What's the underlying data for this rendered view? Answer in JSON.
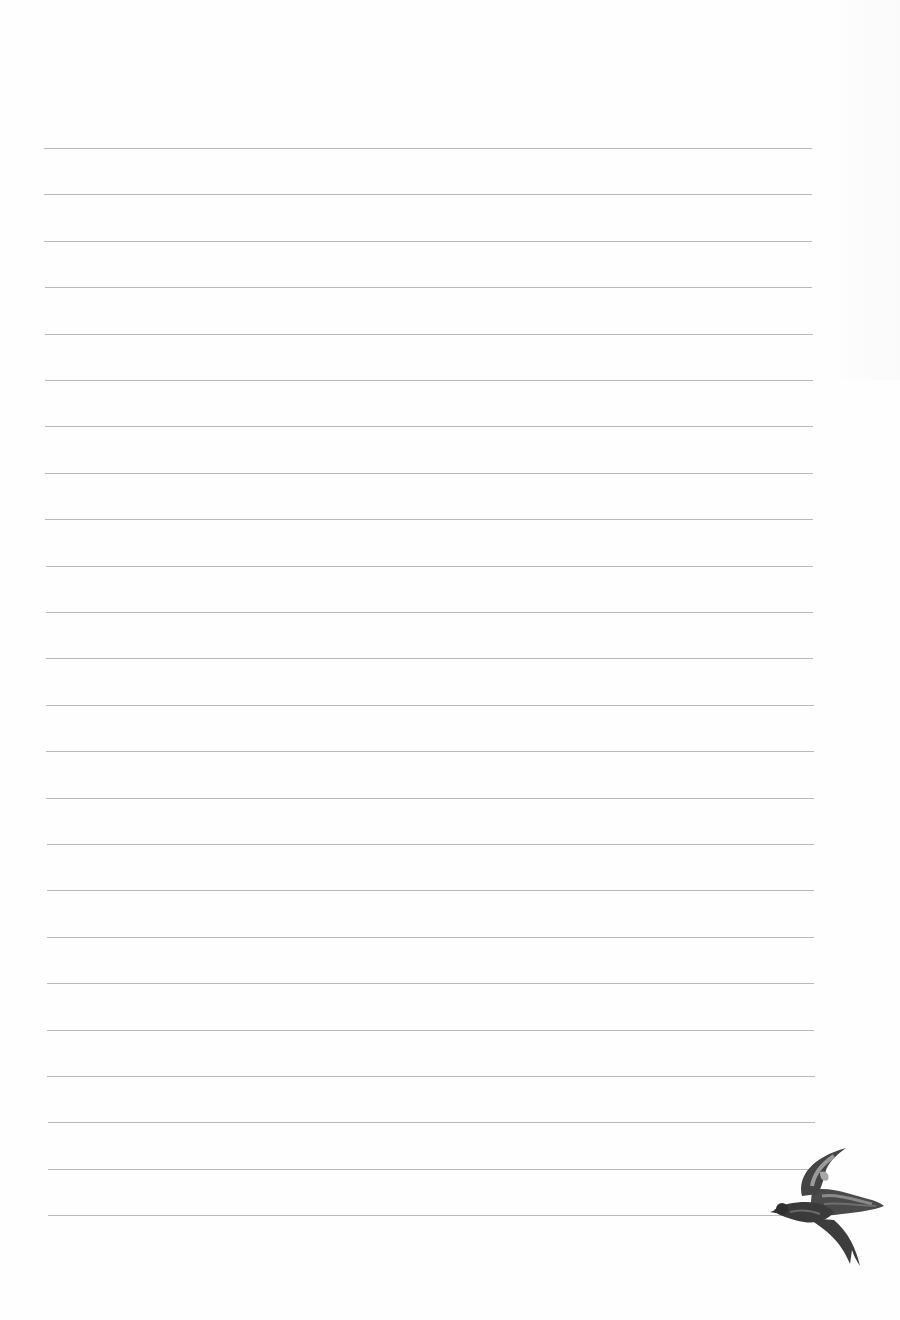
{
  "page": {
    "type": "lined-writing-paper",
    "background_color": "#fefefe",
    "line_color": "#b9b9b9",
    "line_count": 24,
    "first_line_y": 148,
    "line_spacing": 46.4,
    "line_left_top": 44,
    "line_left_bottom": 48,
    "line_right_top": 812,
    "line_right_bottom": 815
  },
  "decoration": {
    "icon": "swallow-bird-icon",
    "position": "bottom-right",
    "color": "#3a3a3a"
  }
}
